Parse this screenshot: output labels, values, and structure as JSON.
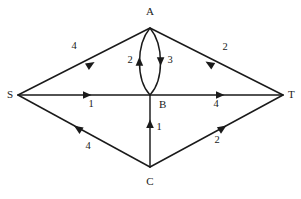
{
  "diagram": {
    "type": "flow-network",
    "background_color": "#ffffff",
    "line_color": "#1a1a1a",
    "nodes": [
      {
        "id": "S",
        "label": "S",
        "x": 18,
        "y": 95,
        "label_x": 13,
        "label_y": 95
      },
      {
        "id": "A",
        "label": "A",
        "x": 150,
        "y": 28,
        "label_x": 150,
        "label_y": 12
      },
      {
        "id": "B",
        "label": "B",
        "x": 150,
        "y": 95,
        "label_x": 159,
        "label_y": 105
      },
      {
        "id": "C",
        "label": "C",
        "x": 150,
        "y": 167,
        "label_x": 150,
        "label_y": 181
      },
      {
        "id": "T",
        "label": "T",
        "x": 283,
        "y": 95,
        "label_x": 288,
        "label_y": 95
      }
    ],
    "edges": [
      {
        "id": "S-A",
        "from": "S",
        "to": "A",
        "weight": "4",
        "shape": "straight",
        "arrow_at": 0.58,
        "label_x": 74,
        "label_y": 47
      },
      {
        "id": "T-A",
        "from": "T",
        "to": "A",
        "weight": "2",
        "shape": "straight",
        "arrow_at": 0.55,
        "label_x": 225,
        "label_y": 48
      },
      {
        "id": "S-B",
        "from": "S",
        "to": "B",
        "weight": "1",
        "shape": "straight",
        "arrow_at": 0.62,
        "label_x": 91,
        "label_y": 105
      },
      {
        "id": "B-T",
        "from": "B",
        "to": "T",
        "weight": "4",
        "shape": "straight",
        "arrow_at": 0.6,
        "label_x": 216,
        "label_y": 105
      },
      {
        "id": "C-S",
        "from": "C",
        "to": "S",
        "weight": "4",
        "shape": "straight",
        "arrow_at": 0.6,
        "label_x": 88,
        "label_y": 147
      },
      {
        "id": "C-T",
        "from": "C",
        "to": "T",
        "weight": "2",
        "shape": "straight",
        "arrow_at": 0.62,
        "label_x": 217,
        "label_y": 141
      },
      {
        "id": "C-B",
        "from": "C",
        "to": "B",
        "weight": "1",
        "shape": "straight",
        "arrow_at": 0.6,
        "label_x": 159,
        "label_y": 128
      },
      {
        "id": "B-A",
        "from": "B",
        "to": "A",
        "weight": "2",
        "shape": "curve-left",
        "arrow_at": 0.56,
        "label_x": 132,
        "label_y": 61
      },
      {
        "id": "A-B",
        "from": "A",
        "to": "B",
        "weight": "3",
        "shape": "curve-right",
        "arrow_at": 0.56,
        "label_x": 169,
        "label_y": 61
      }
    ]
  }
}
